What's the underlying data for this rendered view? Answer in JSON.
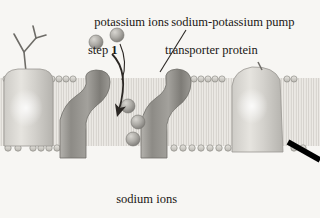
{
  "figure": {
    "background_color": "#f7f6f3",
    "text_color": "#1a1714"
  },
  "labels": {
    "potassium": {
      "line1": "potassium ions",
      "line2_prefix": "step ",
      "line2_number": "1"
    },
    "pump": {
      "line1": "sodium-potassium pump",
      "line2": "transporter protein"
    },
    "sodium": {
      "line1": "sodium ions",
      "line2_prefix": "step ",
      "line2_number": "2"
    }
  },
  "structures": {
    "membrane": {
      "name": "phospholipid bilayer",
      "top_y": 72,
      "bottom_y": 152,
      "head_color": "#cfcdc8",
      "tail_color": "#e2e0db"
    },
    "proteins": [
      {
        "name": "membrane-protein-left",
        "x": 2,
        "width": 52,
        "shade": "light"
      },
      {
        "name": "transport-protein-channel-left",
        "x": 57,
        "width": 52,
        "shade": "dark"
      },
      {
        "name": "transport-protein-channel-right",
        "x": 137,
        "width": 54,
        "shade": "dark"
      },
      {
        "name": "membrane-protein-right",
        "x": 228,
        "width": 58,
        "shade": "light"
      }
    ],
    "glycoprotein_chain": {
      "name": "branched carbohydrate chain",
      "x": 14,
      "y": 20
    }
  },
  "ions": {
    "potassium": [
      {
        "cx": 96,
        "cy": 42,
        "r": 7
      },
      {
        "cx": 117,
        "cy": 35,
        "r": 7
      }
    ],
    "sodium": [
      {
        "cx": 128,
        "cy": 106,
        "r": 7
      },
      {
        "cx": 138,
        "cy": 122,
        "r": 7
      },
      {
        "cx": 133,
        "cy": 139,
        "r": 7
      }
    ],
    "ion_color": "#a8a6a1"
  },
  "arrows": [
    {
      "name": "inward-transport-arrow",
      "type": "curved",
      "color": "#2b2724"
    },
    {
      "name": "next-step-arrow",
      "type": "straight",
      "color": "#000000"
    }
  ],
  "leader_lines": [
    {
      "name": "potassium-leader-line"
    },
    {
      "name": "pump-leader-line"
    }
  ]
}
